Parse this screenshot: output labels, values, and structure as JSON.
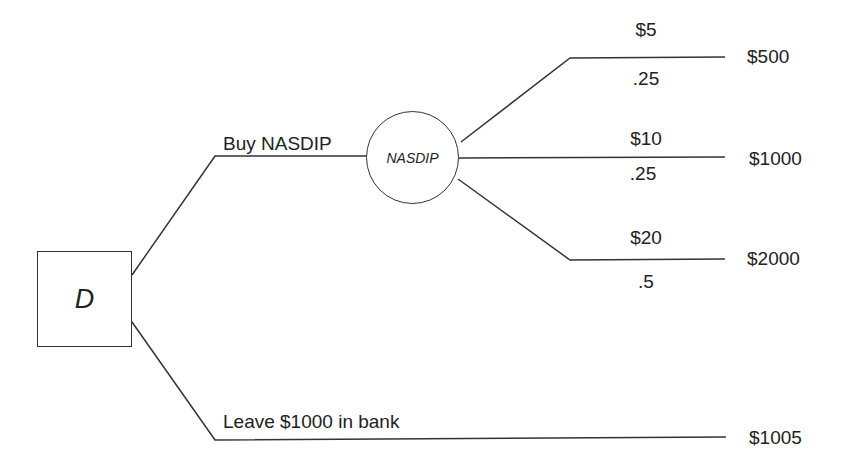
{
  "diagram": {
    "type": "decision-tree",
    "decision_node": {
      "label": "D"
    },
    "chance_node": {
      "label": "NASDIP"
    },
    "decisions": [
      {
        "label": "Buy NASDIP"
      },
      {
        "label": "Leave $1000 in bank",
        "payoff": "$1005"
      }
    ],
    "outcomes": [
      {
        "price": "$5",
        "probability": ".25",
        "payoff": "$500"
      },
      {
        "price": "$10",
        "probability": ".25",
        "payoff": "$1000"
      },
      {
        "price": "$20",
        "probability": ".5",
        "payoff": "$2000"
      }
    ]
  }
}
